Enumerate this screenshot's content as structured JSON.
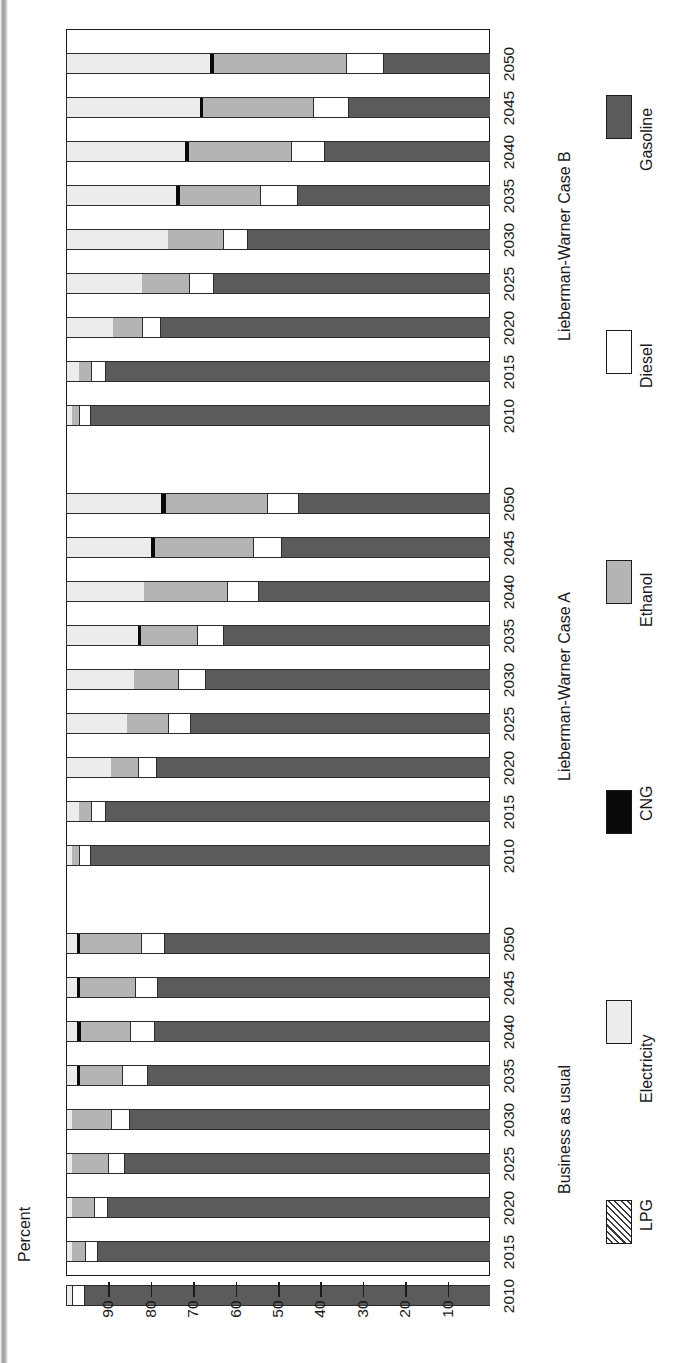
{
  "axis": {
    "title": "Percent",
    "ticks": [
      90,
      80,
      70,
      60,
      50,
      40,
      30,
      20,
      10
    ],
    "range": [
      0,
      100
    ]
  },
  "groups": [
    {
      "id": "lw-case-b",
      "label": "Lieberman-Warner Case B"
    },
    {
      "id": "lw-case-a",
      "label": "Lieberman-Warner Case A"
    },
    {
      "id": "bau",
      "label": "Business as usual"
    }
  ],
  "legend": [
    {
      "key": "gasoline",
      "label": "Gasoline",
      "color": "#5b5b5b"
    },
    {
      "key": "diesel",
      "label": "Diesel",
      "color": "#ffffff"
    },
    {
      "key": "ethanol",
      "label": "Ethanol",
      "color": "#b4b4b4"
    },
    {
      "key": "cng",
      "label": "CNG",
      "color": "#090909"
    },
    {
      "key": "electricity",
      "label": "Electricity",
      "color": "#ececec"
    },
    {
      "key": "lpg",
      "label": "LPG",
      "color": "hatched"
    }
  ],
  "chart_data": {
    "type": "bar",
    "orientation": "horizontal-stacked-rotated",
    "title": "",
    "xlabel": "Percent",
    "ylabel": "",
    "xlim": [
      0,
      100
    ],
    "grid": false,
    "legend_position": "right",
    "stack_order": [
      "lpg",
      "electricity",
      "cng",
      "ethanol",
      "diesel",
      "gasoline"
    ],
    "categories": [
      "2010",
      "2015",
      "2020",
      "2025",
      "2030",
      "2035",
      "2040",
      "2045",
      "2050"
    ],
    "panels": [
      {
        "name": "Lieberman-Warner Case B",
        "rows": [
          {
            "year": "2050",
            "lpg": 0,
            "electricity": 34.0,
            "cng": 1.0,
            "ethanol": 31.0,
            "diesel": 9.0,
            "gasoline": 25.0
          },
          {
            "year": "2045",
            "lpg": 0,
            "electricity": 31.5,
            "cng": 0.8,
            "ethanol": 26.0,
            "diesel": 8.5,
            "gasoline": 33.2
          },
          {
            "year": "2040",
            "lpg": 0,
            "electricity": 28.0,
            "cng": 1.0,
            "ethanol": 24.0,
            "diesel": 8.0,
            "gasoline": 39.0
          },
          {
            "year": "2035",
            "lpg": 0,
            "electricity": 26.0,
            "cng": 0.8,
            "ethanol": 19.0,
            "diesel": 9.0,
            "gasoline": 45.2
          },
          {
            "year": "2030",
            "lpg": 0,
            "electricity": 24.0,
            "cng": 0.0,
            "ethanol": 13.0,
            "diesel": 6.0,
            "gasoline": 57.0
          },
          {
            "year": "2025",
            "lpg": 0,
            "electricity": 18.0,
            "cng": 0.0,
            "ethanol": 11.0,
            "diesel": 6.0,
            "gasoline": 65.0
          },
          {
            "year": "2020",
            "lpg": 0,
            "electricity": 11.0,
            "cng": 0.0,
            "ethanol": 7.0,
            "diesel": 4.5,
            "gasoline": 77.5
          },
          {
            "year": "2015",
            "lpg": 0,
            "electricity": 3.0,
            "cng": 0.0,
            "ethanol": 3.0,
            "diesel": 3.5,
            "gasoline": 90.5
          },
          {
            "year": "2010",
            "lpg": 0,
            "electricity": 1.5,
            "cng": 0.0,
            "ethanol": 1.5,
            "diesel": 3.0,
            "gasoline": 94.0
          }
        ]
      },
      {
        "name": "Lieberman-Warner Case A",
        "rows": [
          {
            "year": "2050",
            "lpg": 0,
            "electricity": 22.5,
            "cng": 1.0,
            "ethanol": 24.0,
            "diesel": 7.5,
            "gasoline": 45.0
          },
          {
            "year": "2045",
            "lpg": 0,
            "electricity": 20.0,
            "cng": 1.0,
            "ethanol": 23.0,
            "diesel": 7.0,
            "gasoline": 49.0
          },
          {
            "year": "2040",
            "lpg": 0,
            "electricity": 18.5,
            "cng": 0.0,
            "ethanol": 19.5,
            "diesel": 7.5,
            "gasoline": 54.5
          },
          {
            "year": "2035",
            "lpg": 0,
            "electricity": 17.0,
            "cng": 0.8,
            "ethanol": 13.0,
            "diesel": 6.5,
            "gasoline": 62.7
          },
          {
            "year": "2030",
            "lpg": 0,
            "electricity": 16.0,
            "cng": 0.0,
            "ethanol": 10.5,
            "diesel": 6.5,
            "gasoline": 67.0
          },
          {
            "year": "2025",
            "lpg": 0,
            "electricity": 14.5,
            "cng": 0.0,
            "ethanol": 9.5,
            "diesel": 5.5,
            "gasoline": 70.5
          },
          {
            "year": "2020",
            "lpg": 0,
            "electricity": 10.5,
            "cng": 0.0,
            "ethanol": 6.5,
            "diesel": 4.5,
            "gasoline": 78.5
          },
          {
            "year": "2015",
            "lpg": 0,
            "electricity": 3.0,
            "cng": 0.0,
            "ethanol": 3.0,
            "diesel": 3.5,
            "gasoline": 90.5
          },
          {
            "year": "2010",
            "lpg": 0,
            "electricity": 1.5,
            "cng": 0.0,
            "ethanol": 1.5,
            "diesel": 3.0,
            "gasoline": 94.0
          }
        ]
      },
      {
        "name": "Business as usual",
        "rows": [
          {
            "year": "2050",
            "lpg": 0,
            "electricity": 2.5,
            "cng": 0.8,
            "ethanol": 14.5,
            "diesel": 5.5,
            "gasoline": 76.7
          },
          {
            "year": "2045",
            "lpg": 0,
            "electricity": 2.5,
            "cng": 0.8,
            "ethanol": 13.0,
            "diesel": 5.5,
            "gasoline": 78.2
          },
          {
            "year": "2040",
            "lpg": 0,
            "electricity": 2.5,
            "cng": 1.0,
            "ethanol": 11.5,
            "diesel": 6.0,
            "gasoline": 79.0
          },
          {
            "year": "2035",
            "lpg": 0,
            "electricity": 2.5,
            "cng": 0.8,
            "ethanol": 10.0,
            "diesel": 6.0,
            "gasoline": 80.7
          },
          {
            "year": "2030",
            "lpg": 0,
            "electricity": 1.5,
            "cng": 0.0,
            "ethanol": 9.0,
            "diesel": 4.5,
            "gasoline": 85.0
          },
          {
            "year": "2025",
            "lpg": 0,
            "electricity": 1.5,
            "cng": 0.0,
            "ethanol": 8.5,
            "diesel": 4.0,
            "gasoline": 86.0
          },
          {
            "year": "2020",
            "lpg": 0,
            "electricity": 1.5,
            "cng": 0.0,
            "ethanol": 5.0,
            "diesel": 3.5,
            "gasoline": 90.0
          },
          {
            "year": "2015",
            "lpg": 0,
            "electricity": 1.5,
            "cng": 0.0,
            "ethanol": 3.0,
            "diesel": 3.0,
            "gasoline": 92.5
          },
          {
            "year": "2010",
            "lpg": 0,
            "electricity": 1.5,
            "cng": 0.0,
            "ethanol": 0.0,
            "diesel": 3.0,
            "gasoline": 95.5
          }
        ]
      }
    ]
  }
}
